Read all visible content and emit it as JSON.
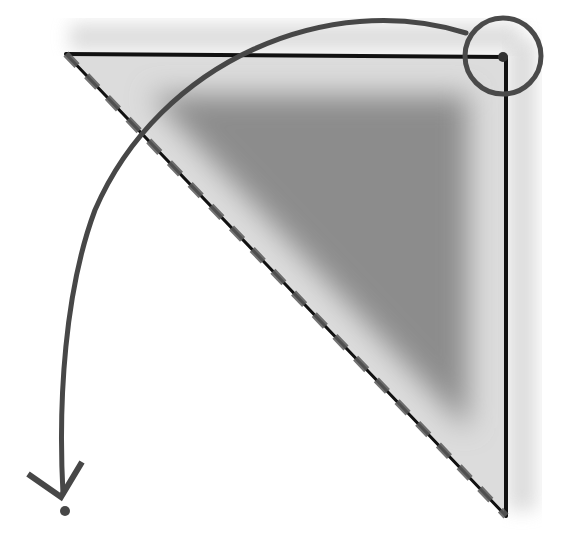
{
  "diagram": {
    "colors": {
      "background": "#ffffff",
      "triangle_fill": "#dadada",
      "triangle_inner_shadow": "#8a8a8a",
      "outer_halo": "#d4d4d4",
      "edge": "#111111",
      "dash_accent": "#555555",
      "arc": "#474747",
      "circle": "#4a4a4a",
      "dot": "#474747"
    },
    "triangle": {
      "vertices": [
        [
          66,
          54
        ],
        [
          506,
          57
        ],
        [
          506,
          516
        ]
      ],
      "hypotenuse_style": "dashed"
    },
    "vertex_marker": {
      "type": "circle",
      "cx": 503,
      "cy": 56,
      "r": 38
    },
    "arc_arrow": {
      "from": [
        466,
        33
      ],
      "to": [
        63,
        494
      ],
      "direction": "counter-clockwise",
      "arrowhead": "open-v"
    },
    "target_point": {
      "cx": 65,
      "cy": 511,
      "r": 5
    }
  }
}
